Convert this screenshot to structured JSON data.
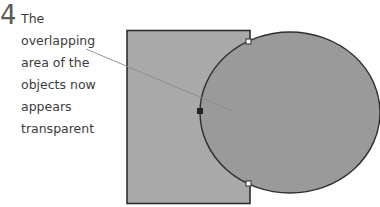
{
  "step": {
    "number": "4",
    "caption_lines": [
      "The",
      "overlapping",
      "area of the",
      "objects now",
      "appears",
      "transparent"
    ]
  },
  "colors": {
    "rectangle_fill": "#a8a8a8",
    "ellipse_fill": "#999999",
    "outline": "#2e2e2e",
    "leader_line": "#8a8a8a",
    "text": "#3c3c3c"
  },
  "shapes": {
    "rectangle": {
      "label": "rectangle"
    },
    "ellipse": {
      "label": "ellipse"
    }
  }
}
